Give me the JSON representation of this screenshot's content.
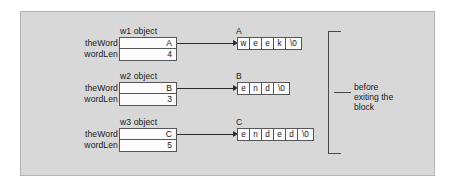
{
  "figure": {
    "kind": "memory-diagram",
    "background_color": "#d8d8d8",
    "border_color": "#b4b4b4",
    "text_color": "#1a1a1a",
    "box_fill": "#fcfcfc",
    "box_border": "#56565a",
    "arrow_color": "#2b2b2b",
    "annotation": {
      "line1": "before",
      "line2": "exiting the",
      "line3": "block"
    },
    "field_labels": {
      "the_word": "theWord",
      "word_len": "wordLen"
    },
    "objects": [
      {
        "title": "w1 object",
        "the_word": "A",
        "word_len": "4",
        "array_label": "A",
        "array_cells": [
          "w",
          "e",
          "e",
          "k",
          "\\0"
        ]
      },
      {
        "title": "w2 object",
        "the_word": "B",
        "word_len": "3",
        "array_label": "B",
        "array_cells": [
          "e",
          "n",
          "d",
          "\\0"
        ]
      },
      {
        "title": "w3 object",
        "the_word": "C",
        "word_len": "5",
        "array_label": "C",
        "array_cells": [
          "e",
          "n",
          "d",
          "e",
          "d",
          "\\0"
        ]
      }
    ]
  }
}
